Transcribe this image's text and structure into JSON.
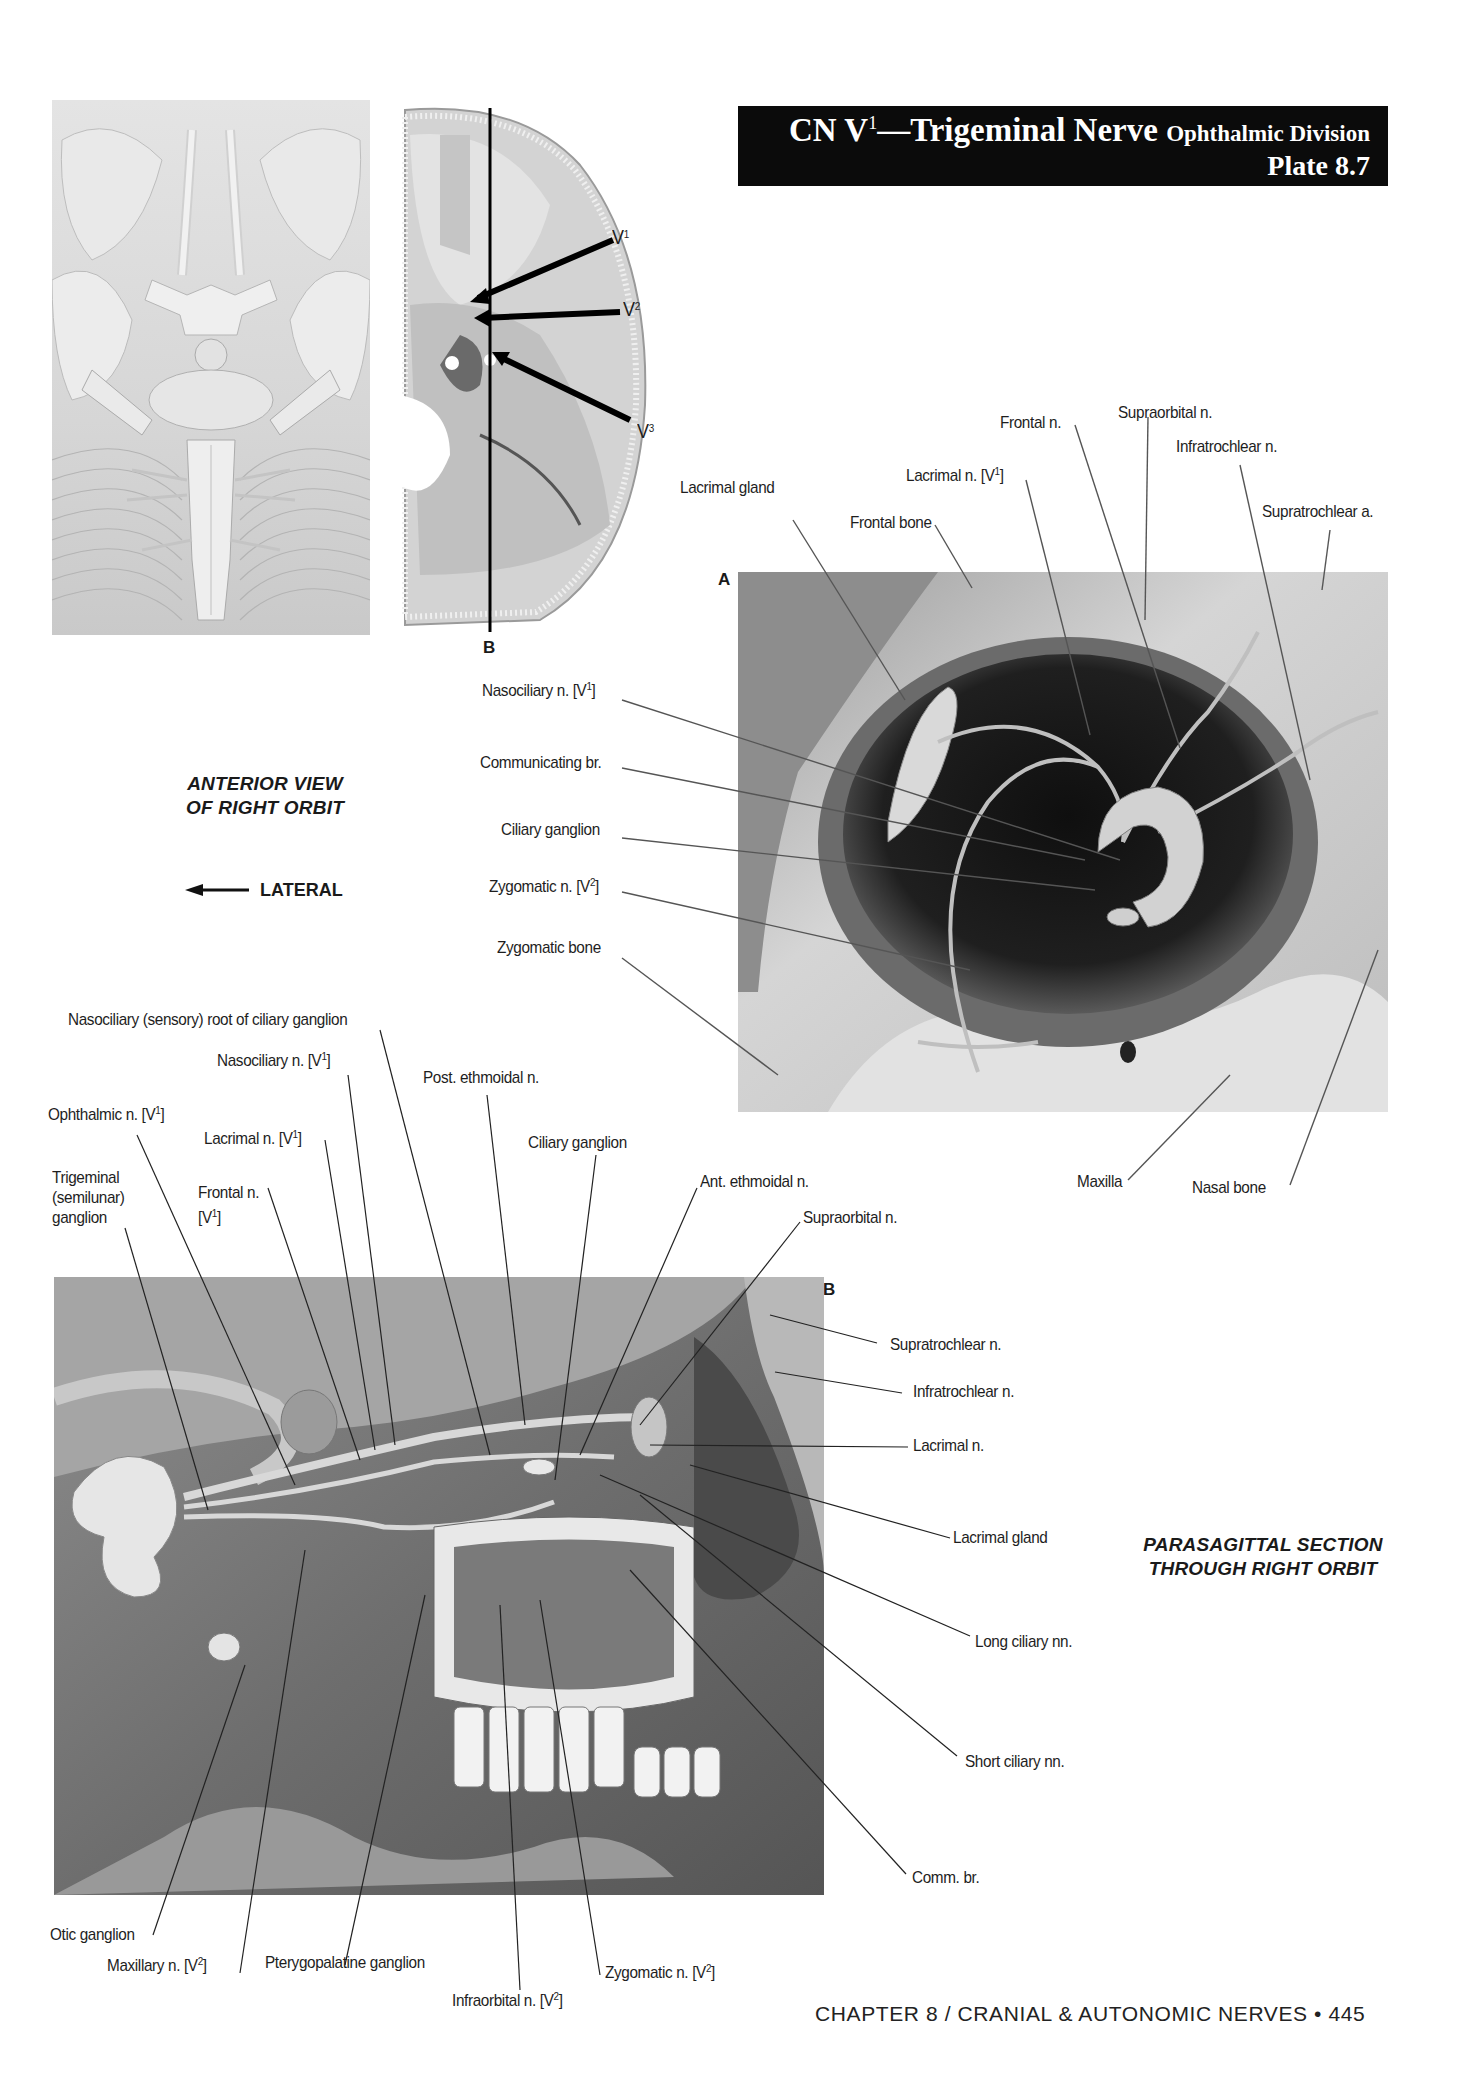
{
  "header": {
    "title_prefix": "CN V",
    "title_sup": "1",
    "title_main": "—Trigeminal Nerve ",
    "title_division": "Ophthalmic Division",
    "plate": "Plate 8.7"
  },
  "figure_top_left": {
    "skull_labels": {
      "v1": "V",
      "v1_sup": "1",
      "v2": "V",
      "v2_sup": "2",
      "v3": "V",
      "v3_sup": "3",
      "section_letter": "B"
    }
  },
  "figure_a": {
    "letter": "A",
    "caption_line1": "ANTERIOR VIEW",
    "caption_line2": "OF RIGHT ORBIT",
    "direction_label": "LATERAL",
    "labels": {
      "lacrimal_gland": "Lacrimal gland",
      "frontal_bone": "Frontal bone",
      "lacrimal_n": "Lacrimal n. [V",
      "lacrimal_n_sup": "1",
      "frontal_n": "Frontal n.",
      "supraorbital_n": "Supraorbital n.",
      "infratrochlear_n": "Infratrochlear n.",
      "supratrochlear_a": "Supratrochlear a.",
      "nasociliary_n": "Nasociliary n. [V",
      "nasociliary_n_sup": "1",
      "communicating_br": "Communicating br.",
      "ciliary_ganglion": "Ciliary ganglion",
      "zygomatic_n": "Zygomatic n. [V",
      "zygomatic_n_sup": "2",
      "zygomatic_bone": "Zygomatic bone",
      "maxilla": "Maxilla",
      "nasal_bone": "Nasal bone"
    }
  },
  "figure_b": {
    "letter": "B",
    "caption_line1": "PARASAGITTAL SECTION",
    "caption_line2": "THROUGH RIGHT ORBIT",
    "labels": {
      "nasociliary_root": "Nasociliary (sensory) root of ciliary ganglion",
      "nasociliary_n": "Nasociliary n. [V",
      "nasociliary_n_sup": "1",
      "post_ethmoidal_n": "Post. ethmoidal n.",
      "ophthalmic_n": "Ophthalmic n. [V",
      "ophthalmic_n_sup": "1",
      "lacrimal_n_v1": "Lacrimal n. [V",
      "lacrimal_n_v1_sup": "1",
      "ciliary_ganglion": "Ciliary ganglion",
      "trigeminal_1": "Trigeminal",
      "trigeminal_2": "(semilunar)",
      "trigeminal_3": "ganglion",
      "frontal_n_1": "Frontal n.",
      "frontal_n_2": "[V",
      "frontal_n_sup": "1",
      "ant_ethmoidal_n": "Ant. ethmoidal n.",
      "supraorbital_n": "Supraorbital n.",
      "supratrochlear_n": "Supratrochlear n.",
      "infratrochlear_n": "Infratrochlear n.",
      "lacrimal_n": "Lacrimal n.",
      "lacrimal_gland": "Lacrimal gland",
      "long_ciliary_nn": "Long ciliary nn.",
      "short_ciliary_nn": "Short ciliary nn.",
      "comm_br": "Comm. br.",
      "otic_ganglion": "Otic ganglion",
      "maxillary_n": "Maxillary n. [V",
      "maxillary_n_sup": "2",
      "pterygopalatine_ganglion": "Pterygopalatine ganglion",
      "infraorbital_n": "Infraorbital n. [V",
      "infraorbital_n_sup": "2",
      "zygomatic_n": "Zygomatic n. [V",
      "zygomatic_n_sup": "2"
    }
  },
  "footer": {
    "text": "CHAPTER 8 / CRANIAL & AUTONOMIC NERVES • 445"
  }
}
